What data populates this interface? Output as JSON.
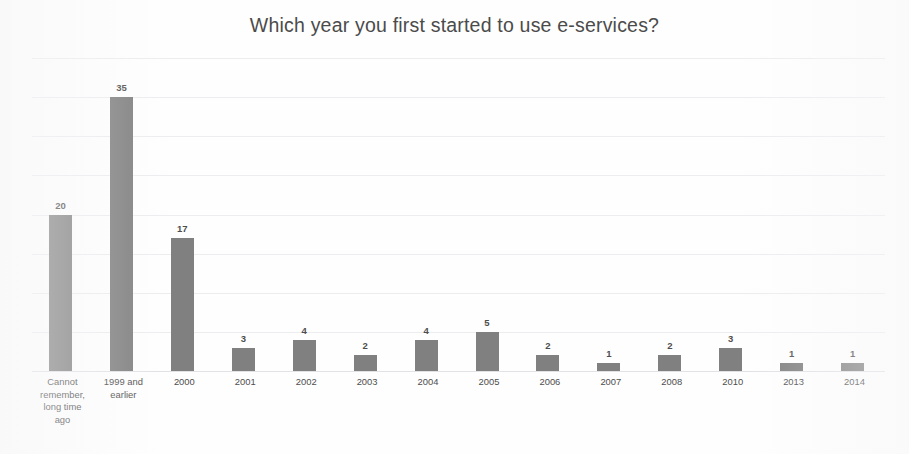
{
  "chart_data": {
    "type": "bar",
    "title": "Which year you first started to use e-services?",
    "xlabel": "",
    "ylabel": "",
    "ylim": [
      0,
      40
    ],
    "ytick_interval": 5,
    "grid": true,
    "gridlines_visible": true,
    "y_axis_labels_visible": false,
    "legend": false,
    "legend_position": "none",
    "data_labels": true,
    "bar_color": "#808080",
    "categories": [
      "Cannot remember, long time ago",
      "1999 and earlier",
      "2000",
      "2001",
      "2002",
      "2003",
      "2004",
      "2005",
      "2006",
      "2007",
      "2008",
      "2010",
      "2013",
      "2014"
    ],
    "category_label_lines": [
      [
        "Cannot",
        "remember,",
        "long time",
        "ago"
      ],
      [
        "1999 and",
        "earlier"
      ],
      [
        "2000"
      ],
      [
        "2001"
      ],
      [
        "2002"
      ],
      [
        "2003"
      ],
      [
        "2004"
      ],
      [
        "2005"
      ],
      [
        "2006"
      ],
      [
        "2007"
      ],
      [
        "2008"
      ],
      [
        "2010"
      ],
      [
        "2013"
      ],
      [
        "2014"
      ]
    ],
    "values": [
      20,
      35,
      17,
      3,
      4,
      2,
      4,
      5,
      2,
      1,
      2,
      3,
      1,
      1
    ],
    "value_labels": [
      "20",
      "35",
      "17",
      "3",
      "4",
      "2",
      "4",
      "5",
      "2",
      "1",
      "2",
      "3",
      "1",
      "1"
    ]
  },
  "colors": {
    "bar": "#808080",
    "title_text": "#4b4b4b",
    "label_text": "#4d4d4d",
    "gridline": "#ededf0",
    "background": "#fefefe"
  }
}
